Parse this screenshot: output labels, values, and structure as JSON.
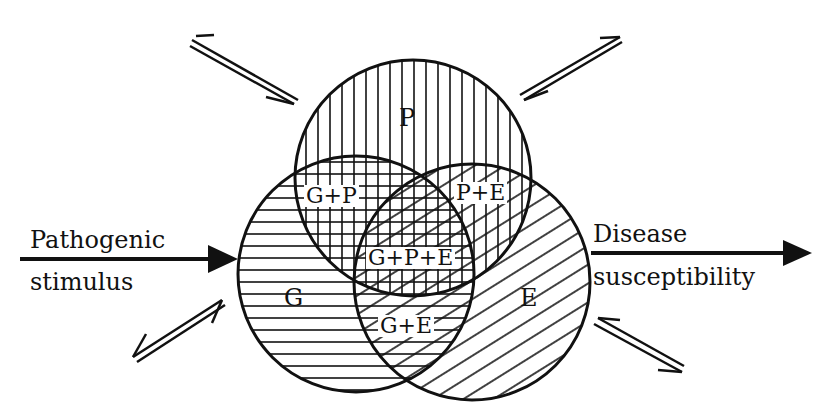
{
  "diagram": {
    "type": "venn",
    "circles": [
      {
        "id": "P",
        "label": "P"
      },
      {
        "id": "G",
        "label": "G"
      },
      {
        "id": "E",
        "label": "E"
      }
    ],
    "intersections": {
      "gp": "G+P",
      "pe": "P+E",
      "ge": "G+E",
      "gpe": "G+P+E"
    },
    "input": {
      "line1": "Pathogenic",
      "line2": "stimulus"
    },
    "output": {
      "line1": "Disease",
      "line2": "susceptibility"
    },
    "colors": {
      "ink": "#111111",
      "background": "#ffffff"
    }
  }
}
